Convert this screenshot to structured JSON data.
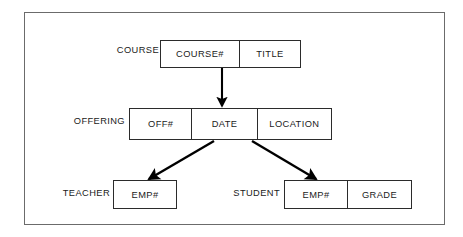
{
  "diagram": {
    "frame": {
      "name": "outer-border"
    },
    "colors": {
      "frame_border": "#6b6b6b",
      "box_border": "#2b2b2b",
      "text": "#1a1a1a",
      "arrow": "#000000",
      "background": "#ffffff"
    },
    "records": [
      {
        "id": "course",
        "label": "COURSE",
        "label_left": 107,
        "label_top": 46,
        "label_width": 52,
        "box_left": 160,
        "box_top": 40,
        "box_width": 141,
        "box_height": 28,
        "fields": [
          {
            "name": "COURSE#",
            "width": 80
          },
          {
            "name": "TITLE",
            "width": 61
          }
        ]
      },
      {
        "id": "offering",
        "label": "OFFERING",
        "label_left": 62,
        "label_top": 117,
        "label_width": 63,
        "box_left": 129,
        "box_top": 108,
        "box_width": 203,
        "box_height": 32,
        "fields": [
          {
            "name": "OFF#",
            "width": 63
          },
          {
            "name": "DATE",
            "width": 66
          },
          {
            "name": "LOCATION",
            "width": 74
          }
        ]
      },
      {
        "id": "teacher",
        "label": "TEACHER",
        "label_left": 52,
        "label_top": 189,
        "label_width": 58,
        "box_left": 113,
        "box_top": 180,
        "box_width": 64,
        "box_height": 29,
        "fields": [
          {
            "name": "EMP#",
            "width": 64
          }
        ]
      },
      {
        "id": "student",
        "label": "STUDENT",
        "label_left": 222,
        "label_top": 189,
        "label_width": 58,
        "box_left": 284,
        "box_top": 180,
        "box_width": 128,
        "box_height": 29,
        "fields": [
          {
            "name": "EMP#",
            "width": 64
          },
          {
            "name": "GRADE",
            "width": 64
          }
        ]
      }
    ],
    "arrows": [
      {
        "id": "course-to-offering",
        "name": "arrow-course-to-offering",
        "from": "COURSE",
        "to": "OFFERING",
        "x1": 222,
        "y1": 68,
        "x2": 222,
        "y2": 106
      },
      {
        "id": "offering-to-teacher",
        "name": "arrow-offering-to-teacher",
        "from": "OFFERING",
        "to": "TEACHER",
        "x1": 214,
        "y1": 141,
        "x2": 149,
        "y2": 179
      },
      {
        "id": "offering-to-student",
        "name": "arrow-offering-to-student",
        "from": "OFFERING",
        "to": "STUDENT",
        "x1": 252,
        "y1": 141,
        "x2": 316,
        "y2": 179
      }
    ]
  }
}
